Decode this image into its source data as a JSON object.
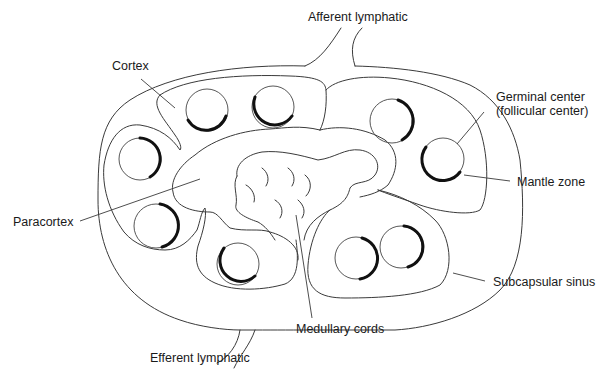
{
  "diagram": {
    "labels": {
      "afferent": "Afferent lymphatic",
      "cortex": "Cortex",
      "germinal_1": "Germinal center",
      "germinal_2": "(follicular center)",
      "mantle": "Mantle zone",
      "paracortex": "Paracortex",
      "subcapsular": "Subcapsular sinus",
      "medullary": "Medullary cords",
      "efferent": "Efferent lymphatic"
    },
    "colors": {
      "background": "#ffffff",
      "line": "#3a3a3a",
      "mantle": "#111111",
      "text": "#1a1a1a"
    },
    "follicles": [
      {
        "cx": 207,
        "cy": 110,
        "r": 21
      },
      {
        "cx": 273,
        "cy": 107,
        "r": 21
      },
      {
        "cx": 140,
        "cy": 159,
        "r": 21
      },
      {
        "cx": 156,
        "cy": 226,
        "r": 22
      },
      {
        "cx": 238,
        "cy": 264,
        "r": 21
      },
      {
        "cx": 392,
        "cy": 121,
        "r": 22
      },
      {
        "cx": 443,
        "cy": 159,
        "r": 21
      },
      {
        "cx": 356,
        "cy": 258,
        "r": 21
      },
      {
        "cx": 401,
        "cy": 247,
        "r": 21
      }
    ]
  }
}
